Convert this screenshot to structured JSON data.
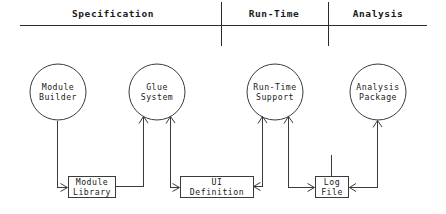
{
  "diagram": {
    "canvas": {
      "width": 446,
      "height": 214,
      "background": "#ffffff"
    },
    "stroke_color": "#3a3a3a",
    "text_color": "#1a1a1a",
    "phases": [
      {
        "id": "specification",
        "label": "Specification",
        "center_x": 113,
        "label_y": 13
      },
      {
        "id": "run-time",
        "label": "Run-Time",
        "center_x": 274,
        "label_y": 13
      },
      {
        "id": "analysis",
        "label": "Analysis",
        "center_x": 378,
        "label_y": 13
      }
    ],
    "header_rule": {
      "x1": 20,
      "x2": 427,
      "y": 25
    },
    "dividers": [
      {
        "id": "divider-spec-runtime",
        "x": 221,
        "y1": 2,
        "y2": 46
      },
      {
        "id": "divider-runtime-analysis",
        "x": 328,
        "y1": 2,
        "y2": 46
      }
    ],
    "processes": [
      {
        "id": "module-builder",
        "line1": "Module",
        "line2": "Builder",
        "cx": 58,
        "cy": 92,
        "r": 28
      },
      {
        "id": "glue-system",
        "line1": "Glue",
        "line2": "System",
        "cx": 157,
        "cy": 92,
        "r": 28
      },
      {
        "id": "run-time-support",
        "line1": "Run-Time",
        "line2": "Support",
        "cx": 275,
        "cy": 92,
        "r": 28
      },
      {
        "id": "analysis-package",
        "line1": "Analysis",
        "line2": "Package",
        "cx": 378,
        "cy": 92,
        "r": 28
      }
    ],
    "stores": [
      {
        "id": "module-library",
        "line1": "Module",
        "line2": "Library",
        "x": 68,
        "y": 176,
        "width": 48,
        "height": 22
      },
      {
        "id": "ui-definition",
        "line1": "UI",
        "line2": "Definition",
        "x": 180,
        "y": 176,
        "width": 74,
        "height": 22
      },
      {
        "id": "log-file",
        "line1": "Log",
        "line2": "File",
        "x": 315,
        "y": 176,
        "width": 34,
        "height": 22
      }
    ],
    "flows": [
      {
        "id": "flow-module-builder-to-library",
        "from": "module-builder",
        "to": "module-library"
      },
      {
        "id": "flow-library-to-glue-system",
        "from": "module-library",
        "to": "glue-system"
      },
      {
        "id": "flow-glue-system-to-ui-definition",
        "from": "glue-system",
        "to": "ui-definition"
      },
      {
        "id": "flow-ui-definition-to-run-time-support",
        "from": "ui-definition",
        "to": "run-time-support"
      },
      {
        "id": "flow-run-time-support-to-log-file",
        "from": "run-time-support",
        "to": "log-file"
      },
      {
        "id": "flow-log-file-to-analysis-package",
        "from": "log-file",
        "to": "analysis-package"
      }
    ]
  }
}
